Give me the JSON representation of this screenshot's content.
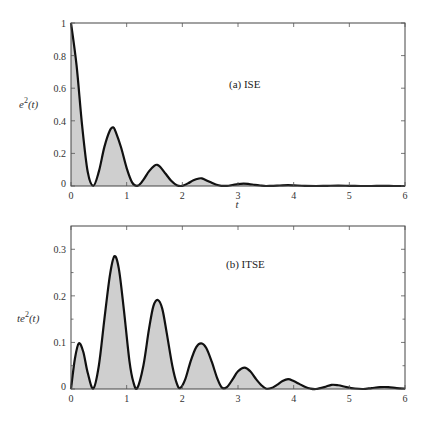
{
  "style": {
    "fill_color": "#cfcfcf",
    "line_color": "#111111",
    "frame_color": "#444444"
  },
  "chart_data": [
    {
      "type": "area",
      "title": "",
      "annotation": "(a) ISE",
      "xlabel": "t",
      "ylabel_main": "e",
      "ylabel_sup": "2",
      "ylabel_tail": "(t)",
      "xlim": [
        0,
        6
      ],
      "ylim": [
        0,
        1
      ],
      "xticks": [
        0,
        1,
        2,
        3,
        4,
        5,
        6
      ],
      "xtick_labels": [
        "0",
        "1",
        "2",
        "3",
        "4",
        "5",
        "6"
      ],
      "yticks": [
        0,
        0.2,
        0.4,
        0.6,
        0.8,
        1
      ],
      "ytick_labels": [
        "0",
        "0.2",
        "0.4",
        "0.6",
        "0.8",
        "1"
      ],
      "yminor": [],
      "grid": false,
      "series": [
        {
          "name": "e^2(t)",
          "x": [
            0,
            0.1,
            0.2,
            0.3,
            0.4,
            0.5,
            0.6,
            0.7,
            0.76,
            0.8,
            0.9,
            1.0,
            1.1,
            1.2,
            1.3,
            1.4,
            1.5,
            1.55,
            1.6,
            1.7,
            1.8,
            1.9,
            2.0,
            2.1,
            2.2,
            2.3,
            2.35,
            2.4,
            2.5,
            2.6,
            2.7,
            2.8,
            2.9,
            3.0,
            3.1,
            3.2,
            3.3,
            3.4,
            3.5,
            3.6,
            3.7,
            3.8,
            3.9,
            4.0,
            4.2,
            4.4,
            4.6,
            4.8,
            5.0,
            5.2,
            5.4,
            5.6,
            5.8,
            6.0
          ],
          "y": [
            1.0,
            0.74,
            0.37,
            0.087,
            0.001,
            0.088,
            0.24,
            0.342,
            0.36,
            0.335,
            0.236,
            0.11,
            0.021,
            0.002,
            0.038,
            0.09,
            0.125,
            0.13,
            0.118,
            0.075,
            0.032,
            0.005,
            0.001,
            0.016,
            0.035,
            0.046,
            0.047,
            0.04,
            0.024,
            0.009,
            0.001,
            0.001,
            0.006,
            0.012,
            0.015,
            0.012,
            0.007,
            0.003,
            0.0,
            0.001,
            0.002,
            0.004,
            0.005,
            0.004,
            0.001,
            0.0,
            0.001,
            0.002,
            0.001,
            0.0,
            0.0,
            0.001,
            0.0,
            0.0
          ]
        }
      ]
    },
    {
      "type": "area",
      "title": "",
      "annotation": "(b) ITSE",
      "xlabel": "",
      "ylabel_main": "te",
      "ylabel_sup": "2",
      "ylabel_tail": "(t)",
      "xlim": [
        0,
        6
      ],
      "ylim": [
        0,
        0.35
      ],
      "xticks": [
        0,
        1,
        2,
        3,
        4,
        5,
        6
      ],
      "xtick_labels": [
        "0",
        "1",
        "2",
        "3",
        "4",
        "5",
        "6"
      ],
      "yticks": [
        0,
        0.1,
        0.2,
        0.3
      ],
      "ytick_labels": [
        "0",
        "0.1",
        "0.2",
        "0.3"
      ],
      "yminor": [
        0.05,
        0.15,
        0.25
      ],
      "grid": false,
      "series": [
        {
          "name": "t e^2(t)",
          "x": [
            0,
            0.07,
            0.14,
            0.22,
            0.3,
            0.4,
            0.5,
            0.6,
            0.7,
            0.78,
            0.86,
            0.95,
            1.05,
            1.12,
            1.19,
            1.3,
            1.4,
            1.48,
            1.56,
            1.64,
            1.72,
            1.82,
            1.9,
            1.96,
            2.05,
            2.15,
            2.25,
            2.34,
            2.43,
            2.53,
            2.63,
            2.71,
            2.8,
            2.9,
            3.0,
            3.12,
            3.22,
            3.32,
            3.42,
            3.5,
            3.6,
            3.7,
            3.8,
            3.9,
            4.0,
            4.1,
            4.2,
            4.3,
            4.4,
            4.55,
            4.68,
            4.8,
            4.95,
            5.1,
            5.25,
            5.4,
            5.55,
            5.7,
            5.85,
            6.0
          ],
          "y": [
            0,
            0.065,
            0.098,
            0.08,
            0.035,
            0.001,
            0.05,
            0.15,
            0.245,
            0.285,
            0.258,
            0.17,
            0.06,
            0.015,
            0.002,
            0.05,
            0.128,
            0.178,
            0.191,
            0.172,
            0.12,
            0.05,
            0.012,
            0.002,
            0.02,
            0.06,
            0.09,
            0.098,
            0.088,
            0.058,
            0.022,
            0.003,
            0.004,
            0.02,
            0.038,
            0.046,
            0.038,
            0.022,
            0.008,
            0.001,
            0.002,
            0.009,
            0.017,
            0.021,
            0.017,
            0.011,
            0.005,
            0.001,
            0.0,
            0.004,
            0.009,
            0.008,
            0.004,
            0.001,
            0.0,
            0.002,
            0.004,
            0.004,
            0.002,
            0.001
          ]
        }
      ]
    }
  ]
}
